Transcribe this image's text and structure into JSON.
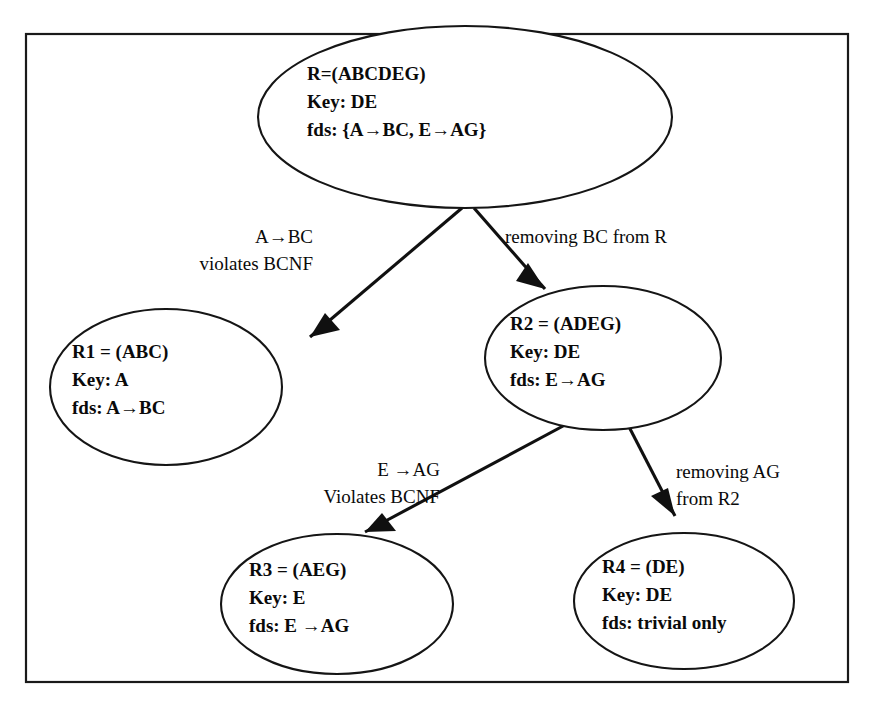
{
  "page": {
    "width": 869,
    "height": 702,
    "background_color": "#ffffff",
    "ink_color": "#101010"
  },
  "frame": {
    "name": "diagram-border",
    "x": 26,
    "y": 34,
    "width": 822,
    "height": 648,
    "stroke_color": "#1a1a1a"
  },
  "nodes": [
    {
      "id": "R",
      "cx": 465,
      "cy": 117,
      "rx": 207,
      "ry": 91,
      "text_x": 307,
      "text_y": 80,
      "lines": [
        "R=(ABCDEG)",
        "Key: DE",
        "fds: {A→BC, E→AG}"
      ]
    },
    {
      "id": "R1",
      "cx": 166,
      "cy": 387,
      "rx": 116,
      "ry": 78,
      "text_x": 72,
      "text_y": 358,
      "lines": [
        "R1 = (ABC)",
        "Key: A",
        "fds: A→BC"
      ]
    },
    {
      "id": "R2",
      "cx": 603,
      "cy": 358,
      "rx": 118,
      "ry": 72,
      "text_x": 510,
      "text_y": 330,
      "lines": [
        "R2 = (ADEG)",
        "Key: DE",
        "fds: E→AG"
      ]
    },
    {
      "id": "R3",
      "cx": 337,
      "cy": 604,
      "rx": 116,
      "ry": 70,
      "text_x": 249,
      "text_y": 576,
      "lines": [
        "R3 = (AEG)",
        "Key: E",
        "fds:  E →AG"
      ]
    },
    {
      "id": "R4",
      "cx": 684,
      "cy": 601,
      "rx": 110,
      "ry": 68,
      "text_x": 602,
      "text_y": 573,
      "lines": [
        "R4 = (DE)",
        "Key: DE",
        "fds: trivial only"
      ]
    }
  ],
  "edges": [
    {
      "id": "R-to-R1",
      "from": "R",
      "to": "R1",
      "path": "M 462 208 L 310 337",
      "arrow": "M 310 337 L 340 330 L 325 313 Z",
      "label_lines": [
        "A→BC",
        "violates BCNF"
      ],
      "label_x": 313,
      "label_y": 243,
      "label_anchor": "end",
      "label_line_gap": 27
    },
    {
      "id": "R-to-R2",
      "from": "R",
      "to": "R2",
      "path": "M 474 208 L 545 289",
      "arrow": "M 545 289 L 516 281 L 528 263 Z",
      "label_lines": [
        "removing BC from R"
      ],
      "label_x": 505,
      "label_y": 243,
      "label_anchor": "start",
      "label_line_gap": 27
    },
    {
      "id": "R2-to-R3",
      "from": "R2",
      "to": "R3",
      "path": "M 578 418 L 365 532",
      "arrow": "M 365 532 L 396 531 L 382 513 Z",
      "label_lines": [
        "E →AG",
        "Violates BCNF"
      ],
      "label_x": 440,
      "label_y": 476,
      "label_anchor": "end",
      "label_line_gap": 27
    },
    {
      "id": "R2-to-R4",
      "from": "R2",
      "to": "R4",
      "path": "M 626 421 L 675 516",
      "arrow": "M 675 516 L 651 496 L 668 488 Z",
      "label_lines": [
        "removing AG",
        "from R2"
      ],
      "label_x": 676,
      "label_y": 478,
      "label_anchor": "start",
      "label_line_gap": 27
    }
  ]
}
